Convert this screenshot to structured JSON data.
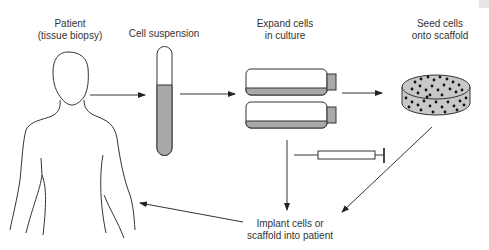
{
  "diagram": {
    "steps": {
      "patient": {
        "line1": "Patient",
        "line2": "(tissue biopsy)"
      },
      "cell_suspension": {
        "line1": "Cell suspension"
      },
      "expand": {
        "line1": "Expand cells",
        "line2": "in culture"
      },
      "seed": {
        "line1": "Seed cells",
        "line2": "onto scaffold"
      },
      "implant": {
        "line1": "Implant cells or",
        "line2": "scaffold into patient"
      }
    },
    "colors": {
      "line": "#333333",
      "fill": "#a9a9a9",
      "scaffold": "#c8c8c8",
      "dot": "#111111"
    }
  }
}
